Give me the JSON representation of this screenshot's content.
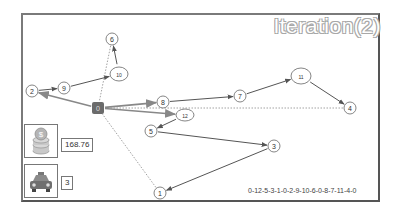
{
  "title": "Iteration(2)",
  "route_text": "0-12-5-3-1-0-2-9-10-6-0-8-7-11-4-0",
  "stats": {
    "cost": {
      "icon": "coins-icon",
      "value": "168.76"
    },
    "vehicles": {
      "icon": "taxi-icon",
      "value": "3"
    }
  },
  "colors": {
    "depot": "#6b6b6b",
    "edge": "#555555",
    "return_edge": "#8a8a8a",
    "frame": "#7a7a7a",
    "title_outline": "#a8a8a8"
  },
  "depot": {
    "id": "0",
    "x": 98,
    "y": 108
  },
  "nodes": [
    {
      "id": "1",
      "x": 160,
      "y": 193,
      "rx": 6,
      "ry": 6
    },
    {
      "id": "2",
      "x": 32,
      "y": 91,
      "rx": 6,
      "ry": 6
    },
    {
      "id": "3",
      "x": 274,
      "y": 146,
      "rx": 6,
      "ry": 6
    },
    {
      "id": "4",
      "x": 350,
      "y": 108,
      "rx": 6,
      "ry": 6
    },
    {
      "id": "5",
      "x": 151,
      "y": 131,
      "rx": 6,
      "ry": 6
    },
    {
      "id": "6",
      "x": 112,
      "y": 39,
      "rx": 6,
      "ry": 6
    },
    {
      "id": "7",
      "x": 240,
      "y": 96,
      "rx": 6,
      "ry": 6
    },
    {
      "id": "8",
      "x": 163,
      "y": 102,
      "rx": 6,
      "ry": 6
    },
    {
      "id": "9",
      "x": 64,
      "y": 88,
      "rx": 6,
      "ry": 6
    },
    {
      "id": "10",
      "x": 119,
      "y": 74,
      "rx": 9,
      "ry": 7
    },
    {
      "id": "11",
      "x": 301,
      "y": 76,
      "rx": 10,
      "ry": 8
    },
    {
      "id": "12",
      "x": 185,
      "y": 115,
      "rx": 9,
      "ry": 6
    }
  ],
  "routes": [
    {
      "name": "route-1",
      "sequence": [
        "0",
        "12",
        "5",
        "3",
        "1",
        "0"
      ]
    },
    {
      "name": "route-2",
      "sequence": [
        "0",
        "2",
        "9",
        "10",
        "6",
        "0"
      ]
    },
    {
      "name": "route-3",
      "sequence": [
        "0",
        "8",
        "7",
        "11",
        "4",
        "0"
      ]
    }
  ]
}
